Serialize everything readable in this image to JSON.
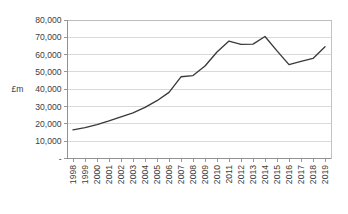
{
  "chart_data": {
    "type": "line",
    "title": "",
    "subtitle": "",
    "xlabel": "",
    "ylabel": "£m",
    "ylim": [
      0,
      80000
    ],
    "ytick_labels": [
      "80,000",
      "70,000",
      "60,000",
      "50,000",
      "40,000",
      "30,000",
      "20,000",
      "10,000",
      "-"
    ],
    "ytick_values": [
      80000,
      70000,
      60000,
      50000,
      40000,
      30000,
      20000,
      10000,
      0
    ],
    "grid": true,
    "legend": false,
    "legend_position": "none",
    "line_color": "#3a3a3a",
    "grid_color": "#c9c9c9",
    "frame_color": "#b4b4b4",
    "categories": [
      "1998",
      "1999",
      "2000",
      "2001",
      "2002",
      "2003",
      "2004",
      "2005",
      "2006",
      "2007",
      "2008",
      "2009",
      "2010",
      "2011",
      "2012",
      "2013",
      "2014",
      "2015",
      "2016",
      "2017",
      "2018",
      "2019"
    ],
    "values": [
      16500,
      17800,
      19600,
      21700,
      24100,
      26400,
      29500,
      33400,
      38200,
      47200,
      47900,
      53400,
      61500,
      67800,
      65900,
      66100,
      70500,
      62200,
      54200,
      56100,
      57800,
      64500
    ],
    "series": [
      {
        "name": "",
        "values": [
          16500,
          17800,
          19600,
          21700,
          24100,
          26400,
          29500,
          33400,
          38200,
          47200,
          47900,
          53400,
          61500,
          67800,
          65900,
          66100,
          70500,
          62200,
          54200,
          56100,
          57800,
          64500
        ]
      }
    ]
  }
}
